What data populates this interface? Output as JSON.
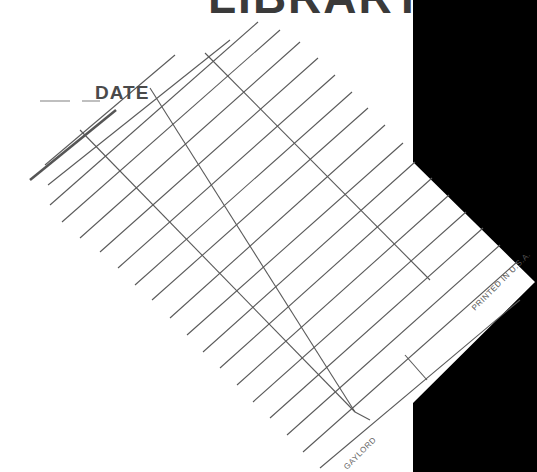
{
  "card": {
    "title_fragment": "LIBRARY",
    "date_label": "DATE",
    "printed_label": "PRINTED IN U.S.A.",
    "brand_label": "GAYLORD"
  },
  "colors": {
    "paper": "#ffffff",
    "grid_line": "#5a5a5a",
    "background": "#000000"
  }
}
